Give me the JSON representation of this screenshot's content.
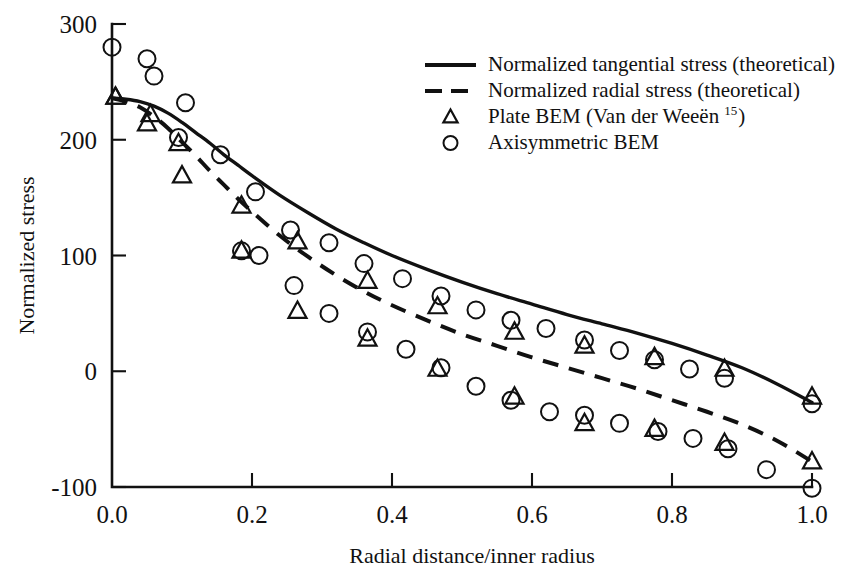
{
  "chart_data": {
    "type": "line",
    "title": "",
    "xlabel": "Radial distance/inner radius",
    "ylabel": "Normalized stress",
    "xlim": [
      0.0,
      1.0
    ],
    "ylim": [
      -100,
      300
    ],
    "xticks": [
      "0.0",
      "0.2",
      "0.4",
      "0.6",
      "0.8",
      "1.0"
    ],
    "xtick_values": [
      0.0,
      0.2,
      0.4,
      0.6,
      0.8,
      1.0
    ],
    "yticks": [
      "300",
      "200",
      "100",
      "0",
      "-100"
    ],
    "ytick_values": [
      300,
      200,
      100,
      0,
      -100
    ],
    "grid": false,
    "legend_position": "upper-right",
    "series": [
      {
        "name": "Normalized tangential stress (theoretical)",
        "style": "solid-line",
        "x": [
          0.0,
          0.02,
          0.04,
          0.06,
          0.08,
          0.1,
          0.12,
          0.14,
          0.16,
          0.18,
          0.2,
          0.24,
          0.28,
          0.32,
          0.36,
          0.4,
          0.45,
          0.5,
          0.55,
          0.6,
          0.65,
          0.7,
          0.75,
          0.8,
          0.85,
          0.9,
          0.95,
          1.0
        ],
        "y": [
          236,
          235,
          233,
          229,
          223,
          215,
          206,
          197,
          187,
          178,
          169,
          152,
          137,
          123,
          111,
          100,
          88,
          77,
          67,
          58,
          49,
          41,
          33,
          24,
          14,
          3,
          -11,
          -27
        ]
      },
      {
        "name": "Normalized radial stress (theoretical)",
        "style": "dashed-line",
        "x": [
          0.0,
          0.02,
          0.04,
          0.06,
          0.08,
          0.1,
          0.12,
          0.14,
          0.16,
          0.18,
          0.2,
          0.24,
          0.28,
          0.32,
          0.36,
          0.4,
          0.45,
          0.5,
          0.55,
          0.6,
          0.65,
          0.7,
          0.75,
          0.8,
          0.85,
          0.9,
          0.95,
          1.0
        ],
        "y": [
          236,
          233,
          228,
          220,
          210,
          198,
          186,
          173,
          161,
          149,
          138,
          117,
          99,
          83,
          69,
          57,
          44,
          32,
          22,
          12,
          3,
          -6,
          -15,
          -25,
          -35,
          -46,
          -60,
          -78
        ]
      },
      {
        "name": "Plate BEM (Van der Weeën 15) — tangential",
        "style": "triangle-marker",
        "x": [
          0.005,
          0.055,
          0.095,
          0.185,
          0.265,
          0.365,
          0.465,
          0.575,
          0.675,
          0.775,
          0.875,
          1.0
        ],
        "y": [
          237,
          222,
          197,
          143,
          112,
          78,
          56,
          34,
          22,
          12,
          2,
          -22
        ]
      },
      {
        "name": "Plate BEM (Van der Weeën 15) — radial",
        "style": "triangle-marker",
        "x": [
          0.005,
          0.05,
          0.1,
          0.185,
          0.265,
          0.365,
          0.465,
          0.575,
          0.675,
          0.775,
          0.875,
          1.0
        ],
        "y": [
          237,
          214,
          169,
          104,
          52,
          28,
          2,
          -22,
          -45,
          -50,
          -62,
          -78
        ]
      },
      {
        "name": "Axisymmetric BEM — tangential",
        "style": "circle-marker",
        "x": [
          0.0,
          0.05,
          0.06,
          0.105,
          0.155,
          0.205,
          0.255,
          0.31,
          0.36,
          0.415,
          0.47,
          0.52,
          0.57,
          0.62,
          0.675,
          0.725,
          0.775,
          0.825,
          0.875,
          1.0
        ],
        "y": [
          280,
          270,
          255,
          232,
          187,
          155,
          122,
          111,
          93,
          80,
          65,
          53,
          44,
          37,
          27,
          18,
          10,
          2,
          -6,
          -28
        ]
      },
      {
        "name": "Axisymmetric BEM — radial",
        "style": "circle-marker",
        "x": [
          0.095,
          0.185,
          0.21,
          0.26,
          0.31,
          0.365,
          0.42,
          0.47,
          0.52,
          0.57,
          0.625,
          0.675,
          0.725,
          0.78,
          0.83,
          0.88,
          0.935,
          1.0
        ],
        "y": [
          202,
          104,
          100,
          74,
          50,
          34,
          19,
          3,
          -13,
          -25,
          -35,
          -38,
          -45,
          -52,
          -58,
          -67,
          -85,
          -101
        ]
      }
    ],
    "legend": [
      {
        "label": "Normalized tangential stress (theoretical)",
        "symbol": "solid-line",
        "sup": ""
      },
      {
        "label": "Normalized radial stress (theoretical)",
        "symbol": "dashed-line",
        "sup": ""
      },
      {
        "label": "Plate BEM (Van der Weeën",
        "label_tail": ")",
        "symbol": "triangle",
        "sup": "15"
      },
      {
        "label": "Axisymmetric BEM",
        "symbol": "circle",
        "sup": ""
      }
    ]
  },
  "colors": {
    "ink": "#111111",
    "background": "#ffffff"
  }
}
